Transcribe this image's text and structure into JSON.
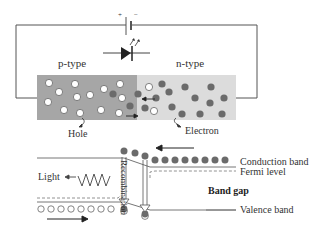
{
  "diagram": {
    "circuit": {
      "battery_plus": "+",
      "battery_minus": "−",
      "p_label": "p-type",
      "n_label": "n-type",
      "hole_label": "Hole",
      "electron_label": "Electron"
    },
    "band": {
      "conduction_band": "Conduction band",
      "fermi_level": "Fermi level",
      "band_gap": "Band gap",
      "valence_band": "Valence band",
      "light": "Light",
      "recombination": "Recombination"
    },
    "colors": {
      "p_region": "#a6a6a6",
      "n_region": "#d9d9d9",
      "electron": "#6b6b6b",
      "hole_fill": "#ffffff",
      "line": "#555555"
    }
  }
}
